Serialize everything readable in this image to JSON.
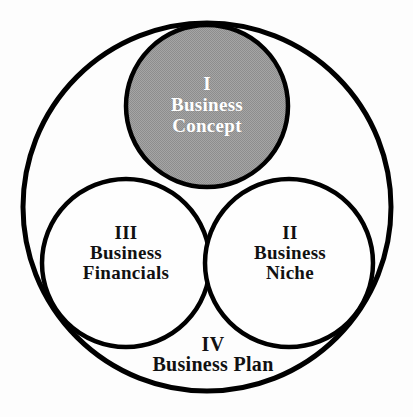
{
  "diagram": {
    "sections": [
      {
        "id": "business-concept",
        "lines": [
          "I",
          "Business",
          "Concept"
        ]
      },
      {
        "id": "business-niche",
        "lines": [
          "II",
          "Business",
          "Niche"
        ]
      },
      {
        "id": "business-financials",
        "lines": [
          "III",
          "Business",
          "Financials"
        ]
      },
      {
        "id": "business-plan",
        "lines": [
          "IV",
          "Business Plan"
        ]
      }
    ],
    "colors": {
      "stroke": "#000000",
      "circle_fill_white": "#fefefe",
      "halftone_light": "#a5a5a5",
      "halftone_dark": "#8d8d8d",
      "concept_text": "#ffffff",
      "label_text": "#111111"
    }
  }
}
